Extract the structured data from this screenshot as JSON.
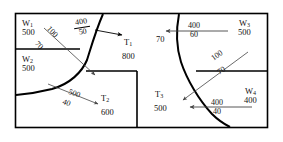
{
  "diagram": {
    "stroke_color": "#000000",
    "thin_stroke_color": "#555555",
    "background": "#ffffff",
    "left_region": {
      "wells": [
        {
          "tag": "W",
          "index": "1",
          "value": "500"
        },
        {
          "tag": "W",
          "index": "2",
          "value": "500"
        }
      ],
      "tanks": [
        {
          "tag": "T",
          "index": "1",
          "value": "800"
        },
        {
          "tag": "T",
          "index": "2",
          "value": "600"
        }
      ],
      "flows": [
        {
          "id": "w1-to-t1",
          "numerator": "400",
          "denominator": "50",
          "direction": "right"
        },
        {
          "id": "w1-to-t2",
          "numerator": "100",
          "denominator": "70",
          "direction": "down-right"
        },
        {
          "id": "w2-to-t2",
          "numerator": "500",
          "denominator": "40",
          "direction": "down-right"
        }
      ]
    },
    "right_region": {
      "wells": [
        {
          "tag": "W",
          "index": "3",
          "value": "500"
        },
        {
          "tag": "W",
          "index": "4",
          "value": "400"
        }
      ],
      "tanks": [
        {
          "tag": "T",
          "index": "3",
          "value": "500"
        }
      ],
      "flows": [
        {
          "id": "w3-to-t1",
          "numerator": "400",
          "denominator": "60",
          "direction": "left",
          "arrow_label": "70"
        },
        {
          "id": "w3-to-t3",
          "numerator": "100",
          "denominator": "70",
          "direction": "down-left"
        },
        {
          "id": "w4-to-t3",
          "numerator": "400",
          "denominator": "40",
          "direction": "left"
        }
      ]
    }
  }
}
